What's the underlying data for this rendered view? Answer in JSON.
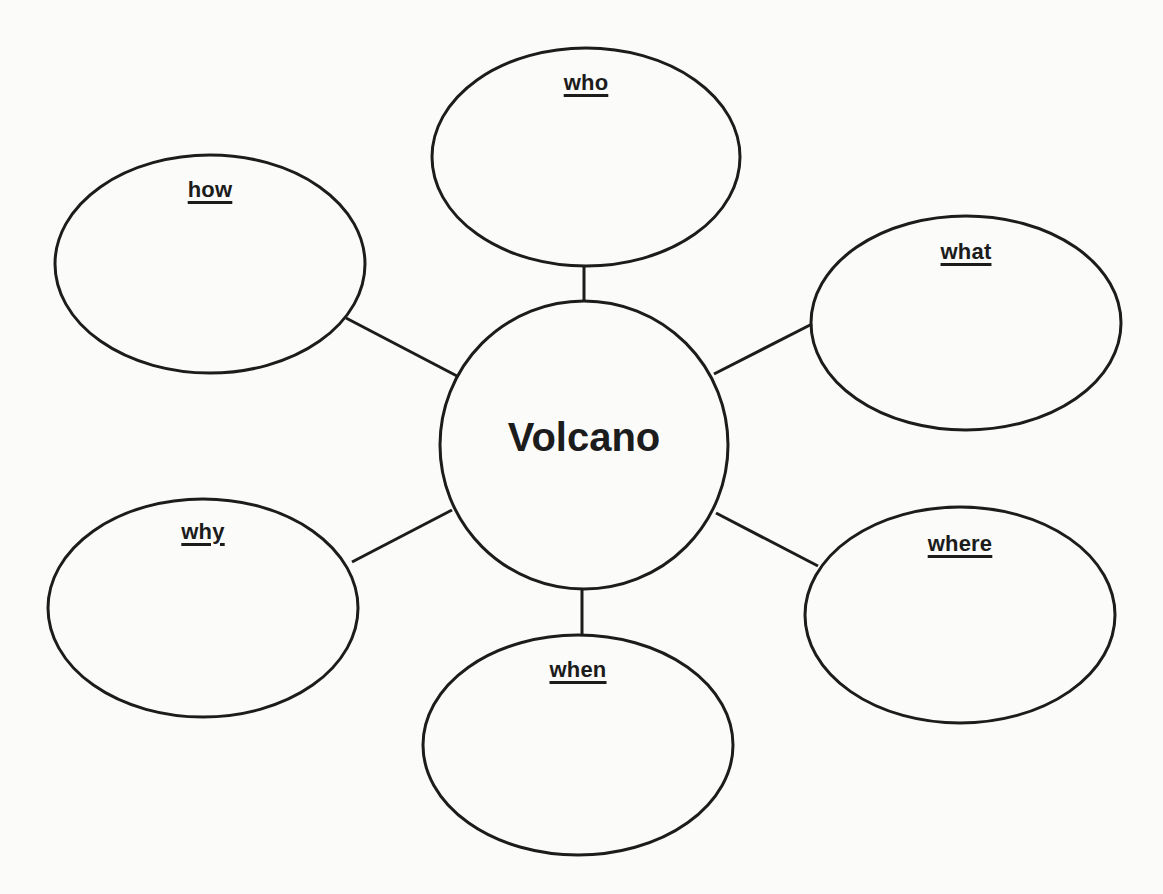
{
  "diagram": {
    "type": "web",
    "stroke_color": "#1c1c1c",
    "background_color": "#fbfbfa",
    "center": {
      "label": "Volcano",
      "cx": 584,
      "cy": 445,
      "r": 144
    },
    "nodes": [
      {
        "id": "who",
        "label": "who",
        "cx": 586,
        "cy": 157,
        "rx": 154,
        "ry": 109,
        "label_y": 70,
        "line": [
          584,
          266,
          584,
          301
        ]
      },
      {
        "id": "how",
        "label": "how",
        "cx": 210,
        "cy": 264,
        "rx": 155,
        "ry": 109,
        "label_y": 177,
        "line": [
          346,
          318,
          457,
          376
        ]
      },
      {
        "id": "what",
        "label": "what",
        "cx": 966,
        "cy": 323,
        "rx": 155,
        "ry": 107,
        "label_y": 239,
        "line": [
          812,
          324,
          714,
          374
        ]
      },
      {
        "id": "why",
        "label": "why",
        "cx": 203,
        "cy": 608,
        "rx": 155,
        "ry": 109,
        "label_y": 519,
        "line": [
          352,
          562,
          452,
          510
        ]
      },
      {
        "id": "where",
        "label": "where",
        "cx": 960,
        "cy": 615,
        "rx": 155,
        "ry": 108,
        "label_y": 531,
        "line": [
          716,
          513,
          818,
          566
        ]
      },
      {
        "id": "when",
        "label": "when",
        "cx": 578,
        "cy": 745,
        "rx": 155,
        "ry": 110,
        "label_y": 657,
        "line": [
          582,
          589,
          582,
          635
        ]
      }
    ]
  }
}
